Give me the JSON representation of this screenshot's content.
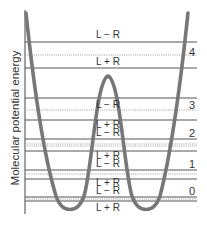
{
  "axis": {
    "y_label": "Molecular potential energy"
  },
  "levels": [
    {
      "number": "4",
      "upper_label": "L − R",
      "lower_label": "L + R",
      "upper_y": 42,
      "dotted_y": 55,
      "lower_y": 68,
      "num_y": 58
    },
    {
      "number": "3",
      "upper_label": "L − R",
      "lower_label": "L + R",
      "upper_y": 98,
      "dotted_y": 110,
      "lower_y": 120,
      "num_y": 108
    },
    {
      "number": "2",
      "upper_label": "L − R",
      "lower_label": "L + R",
      "upper_y": 139,
      "dotted_y": 145,
      "lower_y": 151,
      "num_y": 136
    },
    {
      "number": "1",
      "upper_label": "L − R",
      "lower_label": "L + R",
      "upper_y": 170,
      "dotted_y": 174,
      "lower_y": 179,
      "num_y": 168
    },
    {
      "number": "0",
      "upper_label": "L − R",
      "lower_label": "L + R",
      "upper_y": 197,
      "dotted_y": 199,
      "lower_y": 201,
      "num_y": 194
    }
  ],
  "labels": {
    "l4_minus": "L − R",
    "l4_plus": "L + R",
    "l3_minus": "L − R",
    "l3_plus": "L + R",
    "l2_minus": "L − R",
    "l2_plus": "L + R",
    "l1_minus": "L − R",
    "l1_plus": "L + R",
    "l0_minus": "L − R",
    "l0_plus": "L + R",
    "n4": "4",
    "n3": "3",
    "n2": "2",
    "n1": "1",
    "n0": "0"
  },
  "colors": {
    "curve": "#777777",
    "solid_line": "#555555",
    "dotted_line": "#9a9a9a",
    "text": "#333333"
  }
}
